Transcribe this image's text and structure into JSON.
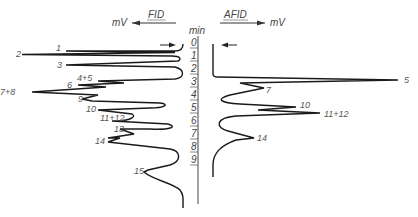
{
  "header": {
    "left_unit": "mV",
    "left_detector": "FID",
    "right_detector": "AFID",
    "right_unit": "mV",
    "axis_unit": "min"
  },
  "axis": {
    "ticks": [
      "0",
      "1",
      "2",
      "3",
      "4",
      "5",
      "6",
      "7",
      "8",
      "9"
    ]
  },
  "fid_peaks": [
    {
      "label": "1",
      "x": 36,
      "y": 49
    },
    {
      "label": "2",
      "x": 16,
      "y": 55
    },
    {
      "label": "3",
      "x": 58,
      "y": 66
    },
    {
      "label": "4+5",
      "x": 78,
      "y": 80
    },
    {
      "label": "6",
      "x": 67,
      "y": 86
    },
    {
      "label": "7+8",
      "x": 0,
      "y": 93
    },
    {
      "label": "9",
      "x": 78,
      "y": 100
    },
    {
      "label": "10",
      "x": 87,
      "y": 110
    },
    {
      "label": "11+12",
      "x": 100,
      "y": 119
    },
    {
      "label": "13",
      "x": 114,
      "y": 130
    },
    {
      "label": "14",
      "x": 95,
      "y": 142
    },
    {
      "label": "15",
      "x": 134,
      "y": 173
    }
  ],
  "afid_peaks": [
    {
      "label": "5",
      "x": 405,
      "y": 83
    },
    {
      "label": "7",
      "x": 265,
      "y": 92
    },
    {
      "label": "10",
      "x": 300,
      "y": 106
    },
    {
      "label": "11+12",
      "x": 324,
      "y": 116
    },
    {
      "label": "14",
      "x": 256,
      "y": 141
    }
  ]
}
